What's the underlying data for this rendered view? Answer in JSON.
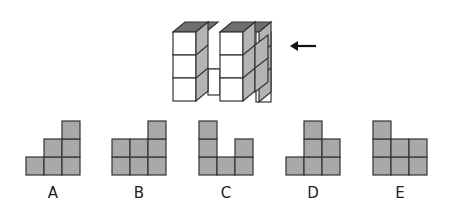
{
  "puzzle": {
    "figure": "3D cube structure",
    "arrow_direction": "left",
    "colors": {
      "cell_fill": "#a9a9a9",
      "cell_stroke": "#333333",
      "cube_front": "#ffffff",
      "cube_side": "#b4b4b4",
      "cube_top": "#6e6e6e"
    }
  },
  "options": [
    {
      "label": "A",
      "cells": [
        [
          0,
          0
        ],
        [
          1,
          0
        ],
        [
          2,
          0
        ],
        [
          1,
          1
        ],
        [
          2,
          1
        ],
        [
          2,
          2
        ]
      ]
    },
    {
      "label": "B",
      "cells": [
        [
          0,
          0
        ],
        [
          1,
          0
        ],
        [
          2,
          0
        ],
        [
          0,
          1
        ],
        [
          1,
          1
        ],
        [
          2,
          1
        ],
        [
          2,
          2
        ]
      ]
    },
    {
      "label": "C",
      "cells": [
        [
          0,
          0
        ],
        [
          1,
          0
        ],
        [
          2,
          0
        ],
        [
          0,
          1
        ],
        [
          2,
          1
        ],
        [
          0,
          2
        ]
      ]
    },
    {
      "label": "D",
      "cells": [
        [
          0,
          0
        ],
        [
          1,
          0
        ],
        [
          2,
          0
        ],
        [
          1,
          1
        ],
        [
          2,
          1
        ],
        [
          1,
          2
        ]
      ]
    },
    {
      "label": "E",
      "cells": [
        [
          0,
          0
        ],
        [
          1,
          0
        ],
        [
          2,
          0
        ],
        [
          0,
          1
        ],
        [
          1,
          1
        ],
        [
          2,
          1
        ],
        [
          0,
          2
        ]
      ]
    }
  ]
}
